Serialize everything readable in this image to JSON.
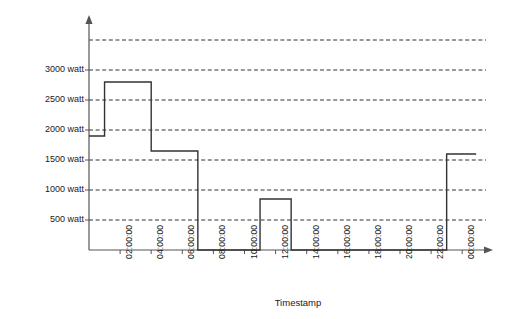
{
  "chart_data": {
    "type": "line",
    "subtype": "step-post",
    "title": "",
    "xlabel": "Timestamp",
    "ylabel": "Power Setpoint",
    "grid": true,
    "grid_style": "dashed-horizontal",
    "legend": "none",
    "line_color": "#333333",
    "grid_color": "#333333",
    "axis_color": "#555555",
    "background": "#ffffff",
    "ylim": [
      0,
      3700
    ],
    "yticks": [
      500,
      1000,
      1500,
      2000,
      2500,
      3000
    ],
    "ytick_labels": [
      "500 watt",
      "1000 watt",
      "1500 watt",
      "2000 watt",
      "2500 watt",
      "3000 watt"
    ],
    "gridlines": [
      500,
      1000,
      1500,
      2000,
      2500,
      3000,
      3500
    ],
    "xlim_hours": [
      0,
      25.2
    ],
    "xticks_hours": [
      2,
      4,
      6,
      8,
      10,
      12,
      14,
      16,
      18,
      20,
      22,
      24
    ],
    "xtick_labels": [
      "02:00:00",
      "04:00:00",
      "06:00:00",
      "08:00:00",
      "10:00:00",
      "12:00:00",
      "14:00:00",
      "16:00:00",
      "18:00:00",
      "20:00:00",
      "22:00:00",
      "00:00:00"
    ],
    "units": "watt",
    "steps": [
      {
        "start_hour": 0,
        "end_hour": 1,
        "value": 1900
      },
      {
        "start_hour": 1,
        "end_hour": 4,
        "value": 2800
      },
      {
        "start_hour": 4,
        "end_hour": 7,
        "value": 1650
      },
      {
        "start_hour": 7,
        "end_hour": 11,
        "value": 0
      },
      {
        "start_hour": 11,
        "end_hour": 13,
        "value": 850
      },
      {
        "start_hour": 13,
        "end_hour": 23,
        "value": 0
      },
      {
        "start_hour": 23,
        "end_hour": 24.9,
        "value": 1600
      }
    ]
  }
}
